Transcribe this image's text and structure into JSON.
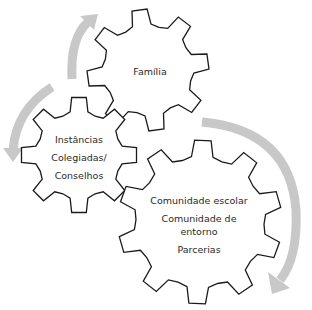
{
  "diagram": {
    "title": "",
    "colors": {
      "gear_stroke": "#1a1a1a",
      "gear_fill": "#ffffff",
      "arrow": "#c8c8c8",
      "text": "#2a2a2a"
    },
    "gears": [
      {
        "id": "familia",
        "cx": 148,
        "cy": 70,
        "outer_r": 61,
        "inner_r": 46,
        "teeth": 8,
        "rotation_deg": -8,
        "label_lines": [
          "Família"
        ],
        "label_x": 150,
        "label_y": 71
      },
      {
        "id": "instancias",
        "cx": 79,
        "cy": 155,
        "outer_r": 58,
        "inner_r": 44,
        "teeth": 8,
        "rotation_deg": 0,
        "label_lines": [
          "Instâncias",
          "Colegiadas/",
          "Conselhos"
        ],
        "label_x": 79,
        "label_y": 157
      },
      {
        "id": "comunidade",
        "cx": 200,
        "cy": 222,
        "outer_r": 82,
        "inner_r": 66,
        "teeth": 10,
        "rotation_deg": 2,
        "label_lines": [
          "Comunidade escolar",
          "Comunidade de",
          "entorno",
          "Parcerias"
        ],
        "label_x": 199,
        "label_y": 225
      }
    ],
    "arrows": [
      {
        "id": "arrow-up-left",
        "path": "M 72 79 Q 70 38 88 22",
        "head": [
          [
            80,
            16
          ],
          [
            98,
            14
          ],
          [
            94,
            30
          ]
        ]
      },
      {
        "id": "arrow-down-left",
        "path": "M 52 87 Q 16 110 13 150",
        "head": [
          [
            3,
            148
          ],
          [
            23,
            148
          ],
          [
            13,
            162
          ]
        ]
      },
      {
        "id": "arrow-right",
        "path": "M 202 122 Q 290 130 296 210 Q 298 258 280 280",
        "head": [
          [
            268,
            272
          ],
          [
            290,
            288
          ],
          [
            272,
            294
          ]
        ]
      }
    ]
  }
}
